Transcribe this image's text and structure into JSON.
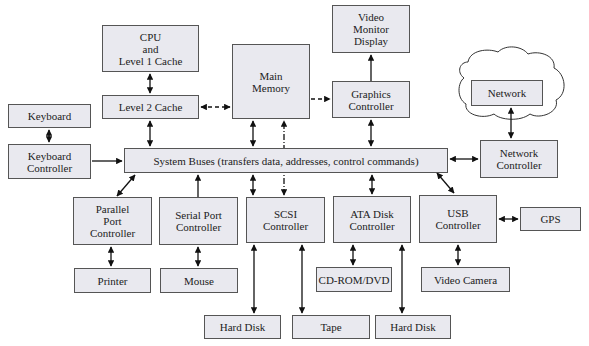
{
  "diagram": {
    "type": "computer-system-architecture",
    "colors": {
      "box_fill": "#e9e9ef",
      "box_border": "#555555",
      "line": "#111111"
    },
    "nodes": [
      {
        "id": "cpu",
        "label": "CPU\nand\nLevel 1 Cache",
        "x": 102,
        "y": 25,
        "w": 97,
        "h": 47
      },
      {
        "id": "l2",
        "label": "Level 2 Cache",
        "x": 102,
        "y": 95,
        "w": 97,
        "h": 24
      },
      {
        "id": "memory",
        "label": "Main\nMemory",
        "x": 232,
        "y": 44,
        "w": 78,
        "h": 75
      },
      {
        "id": "video_monitor",
        "label": "Video\nMonitor\nDisplay",
        "x": 332,
        "y": 5,
        "w": 78,
        "h": 48
      },
      {
        "id": "graphics",
        "label": "Graphics\nController",
        "x": 332,
        "y": 81,
        "w": 78,
        "h": 37
      },
      {
        "id": "network",
        "label": "Network",
        "x": 471,
        "y": 80,
        "w": 72,
        "h": 26
      },
      {
        "id": "network_ctrl",
        "label": "Network\nController",
        "x": 480,
        "y": 140,
        "w": 78,
        "h": 38
      },
      {
        "id": "keyboard",
        "label": "Keyboard",
        "x": 8,
        "y": 104,
        "w": 83,
        "h": 24
      },
      {
        "id": "keyboard_ctrl",
        "label": "Keyboard\nController",
        "x": 8,
        "y": 144,
        "w": 83,
        "h": 35
      },
      {
        "id": "bus",
        "label": "System Buses (transfers data, addresses, control commands)",
        "x": 124,
        "y": 148,
        "w": 324,
        "h": 25
      },
      {
        "id": "parallel",
        "label": "Parallel\nPort\nController",
        "x": 73,
        "y": 197,
        "w": 79,
        "h": 48
      },
      {
        "id": "serial",
        "label": "Serial Port\nController",
        "x": 159,
        "y": 197,
        "w": 79,
        "h": 48
      },
      {
        "id": "scsi",
        "label": "SCSI\nController",
        "x": 246,
        "y": 197,
        "w": 79,
        "h": 46
      },
      {
        "id": "ata",
        "label": "ATA Disk\nController",
        "x": 333,
        "y": 196,
        "w": 78,
        "h": 47
      },
      {
        "id": "usb",
        "label": "USB\nController",
        "x": 419,
        "y": 195,
        "w": 78,
        "h": 48
      },
      {
        "id": "gps",
        "label": "GPS",
        "x": 520,
        "y": 207,
        "w": 61,
        "h": 24
      },
      {
        "id": "printer",
        "label": "Printer",
        "x": 74,
        "y": 268,
        "w": 77,
        "h": 25
      },
      {
        "id": "mouse",
        "label": "Mouse",
        "x": 160,
        "y": 268,
        "w": 78,
        "h": 25
      },
      {
        "id": "cdrom",
        "label": "CD-ROM/DVD",
        "x": 316,
        "y": 267,
        "w": 76,
        "h": 25
      },
      {
        "id": "video_camera",
        "label": "Video Camera",
        "x": 421,
        "y": 267,
        "w": 89,
        "h": 25
      },
      {
        "id": "hard_disk_1",
        "label": "Hard Disk",
        "x": 204,
        "y": 315,
        "w": 77,
        "h": 24
      },
      {
        "id": "tape",
        "label": "Tape",
        "x": 292,
        "y": 315,
        "w": 78,
        "h": 24
      },
      {
        "id": "hard_disk_2",
        "label": "Hard Disk",
        "x": 375,
        "y": 315,
        "w": 76,
        "h": 24
      }
    ],
    "edges": [
      {
        "from": "cpu",
        "to": "l2",
        "style": "solid",
        "dir": "both"
      },
      {
        "from": "l2",
        "to": "memory",
        "style": "dashed",
        "dir": "both"
      },
      {
        "from": "l2",
        "to": "bus",
        "style": "solid",
        "dir": "both"
      },
      {
        "from": "memory",
        "to": "graphics",
        "style": "dashed",
        "dir": "forward"
      },
      {
        "from": "memory",
        "to": "bus",
        "style": "solid",
        "dir": "both"
      },
      {
        "from": "scsi",
        "to": "memory",
        "style": "dash-dot",
        "dir": "both"
      },
      {
        "from": "graphics",
        "to": "video_monitor",
        "style": "solid",
        "dir": "forward"
      },
      {
        "from": "graphics",
        "to": "bus",
        "style": "solid",
        "dir": "both"
      },
      {
        "from": "network",
        "to": "network_ctrl",
        "style": "solid",
        "dir": "both"
      },
      {
        "from": "bus",
        "to": "network_ctrl",
        "style": "solid",
        "dir": "both"
      },
      {
        "from": "keyboard",
        "to": "keyboard_ctrl",
        "style": "solid",
        "dir": "both"
      },
      {
        "from": "keyboard_ctrl",
        "to": "bus",
        "style": "solid",
        "dir": "forward"
      },
      {
        "from": "parallel",
        "to": "bus",
        "style": "solid",
        "dir": "both"
      },
      {
        "from": "serial",
        "to": "bus",
        "style": "solid",
        "dir": "forward"
      },
      {
        "from": "scsi",
        "to": "bus",
        "style": "solid",
        "dir": "both"
      },
      {
        "from": "ata",
        "to": "bus",
        "style": "solid",
        "dir": "both"
      },
      {
        "from": "usb",
        "to": "bus",
        "style": "solid",
        "dir": "both"
      },
      {
        "from": "usb",
        "to": "gps",
        "style": "solid",
        "dir": "both"
      },
      {
        "from": "parallel",
        "to": "printer",
        "style": "solid",
        "dir": "both"
      },
      {
        "from": "serial",
        "to": "mouse",
        "style": "solid",
        "dir": "both"
      },
      {
        "from": "scsi",
        "to": "hard_disk_1",
        "style": "solid",
        "dir": "both"
      },
      {
        "from": "scsi",
        "to": "tape",
        "style": "solid",
        "dir": "both"
      },
      {
        "from": "ata",
        "to": "cdrom",
        "style": "solid",
        "dir": "both"
      },
      {
        "from": "ata",
        "to": "hard_disk_2",
        "style": "solid",
        "dir": "both"
      },
      {
        "from": "usb",
        "to": "video_camera",
        "style": "solid",
        "dir": "both"
      }
    ]
  }
}
